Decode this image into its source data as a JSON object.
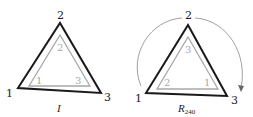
{
  "figures": [
    {
      "caption": "I",
      "outer_labels": {
        "top": "2",
        "left": "1",
        "right": "3"
      },
      "inner_labels": {
        "top": "2",
        "left": "1",
        "right": "3"
      }
    },
    {
      "caption": "R",
      "caption_sub": "240",
      "outer_labels": {
        "top": "2",
        "left": "1",
        "right": "3"
      },
      "inner_labels": {
        "top": "3",
        "left": "2",
        "right": "1"
      }
    }
  ],
  "colors": {
    "outer": "#1a1a1a",
    "inner": "#a8a8a8",
    "arc": "#888888"
  }
}
